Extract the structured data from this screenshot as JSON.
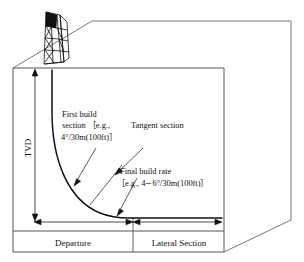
{
  "figure": {
    "type": "engineering-diagram"
  },
  "axes": {
    "vertical_label": "TVD",
    "departure_label": "Departure",
    "lateral_label": "Lateral Section"
  },
  "annotations": {
    "first_build": {
      "line1": "First build",
      "line2": "section ［e.g.,",
      "line3": "4°/30m(100ft)］"
    },
    "tangent": {
      "line1": "Tangent section"
    },
    "final_build": {
      "line1": "Final build rate",
      "line2": "［e.g., 4∼6°/30m(100ft)］"
    }
  },
  "icons": {
    "derrick": "drilling-derrick-icon"
  },
  "colors": {
    "path": "#111111",
    "frame": "#777777",
    "box": "#555555",
    "text": "#111111",
    "background": "#ffffff"
  },
  "geometry": {
    "wellhead_x": 52,
    "wellhead_y": 70,
    "kickoff_y": 110,
    "horizontal_y": 218,
    "landing_x": 133,
    "toe_x": 222,
    "inner_box": {
      "left": 13,
      "top": 68,
      "right": 224,
      "bottom": 252
    }
  }
}
